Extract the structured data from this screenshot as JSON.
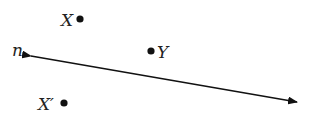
{
  "diagram": {
    "type": "geometry-reflection",
    "line": {
      "label": "n",
      "start": [
        31,
        56
      ],
      "end": [
        297,
        102
      ],
      "arrows": "both",
      "color": "#111111"
    },
    "points": [
      {
        "id": "X",
        "label": "X",
        "x": 80,
        "y": 19,
        "label_x": 61,
        "label_y": 26
      },
      {
        "id": "Y",
        "label": "Y",
        "x": 151,
        "y": 51,
        "label_x": 157,
        "label_y": 58
      },
      {
        "id": "Xprime",
        "label": "X′",
        "x": 64,
        "y": 103,
        "label_x": 38,
        "label_y": 110
      }
    ],
    "line_label": {
      "text": "n",
      "x": 12,
      "y": 56
    }
  }
}
